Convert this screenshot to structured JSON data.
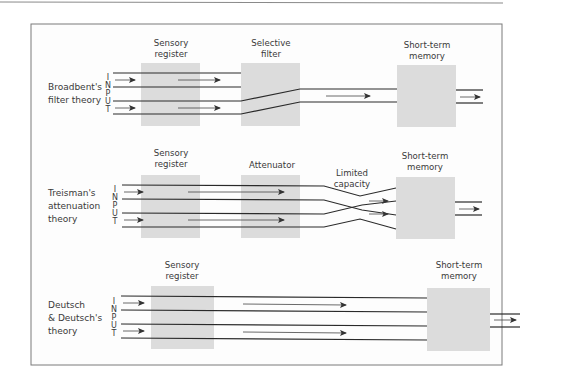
{
  "colors": {
    "box_fill": "#dcdcdc",
    "line": "#2a2a2a",
    "arrow": "#444444",
    "frame": "#7a7a7a",
    "background": "#ffffff",
    "frame_fill": "#fdfdfd"
  },
  "input_letters": [
    "I",
    "N",
    "P",
    "U",
    "T"
  ],
  "panels": [
    {
      "id": "broadbent",
      "theory_lines": [
        "Broadbent's",
        "filter theory"
      ],
      "stages": [
        {
          "lines": [
            "Sensory",
            "register"
          ]
        },
        {
          "lines": [
            "Selective",
            "filter"
          ]
        },
        {
          "lines": [
            "Short-term",
            "memory"
          ]
        }
      ]
    },
    {
      "id": "treisman",
      "theory_lines": [
        "Treisman's",
        "attenuation",
        "theory"
      ],
      "stages": [
        {
          "lines": [
            "Sensory",
            "register"
          ]
        },
        {
          "lines": [
            "Attenuator"
          ]
        },
        {
          "lines": [
            "Limited",
            "capacity"
          ]
        },
        {
          "lines": [
            "Short-term",
            "memory"
          ]
        }
      ]
    },
    {
      "id": "deutsch",
      "theory_lines": [
        "Deutsch",
        "& Deutsch's",
        "theory"
      ],
      "stages": [
        {
          "lines": [
            "Sensory",
            "register"
          ]
        },
        {
          "lines": [
            "Short-term",
            "memory"
          ]
        }
      ]
    }
  ]
}
